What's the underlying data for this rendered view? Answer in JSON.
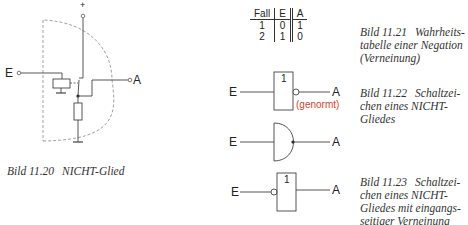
{
  "figure_11_20": {
    "supply_label": "+",
    "input_label": "E",
    "output_label": "A",
    "caption_number": "Bild 11.20",
    "caption_text": "NICHT-Glied"
  },
  "figure_11_21": {
    "table": {
      "headers": [
        "Fall",
        "E",
        "A"
      ],
      "rows": [
        [
          "1",
          "0",
          "1"
        ],
        [
          "2",
          "1",
          "0"
        ]
      ]
    },
    "caption_number": "Bild 11.21",
    "caption_text": "Wahrheits-\ntabelle einer Negation\n(Verneinung)"
  },
  "figure_11_22": {
    "symbol_a": {
      "box_label": "1",
      "input_label": "E",
      "output_label": "A",
      "note": "(genormt)",
      "note_color": "#d9442e"
    },
    "symbol_b": {
      "input_label": "E",
      "output_label": "A"
    },
    "caption_number": "Bild 11.22",
    "caption_text": "Schaltzei-\nchen eines NICHT-\nGliedes"
  },
  "figure_11_23": {
    "box_label": "1",
    "input_label": "E",
    "output_label": "A",
    "caption_number": "Bild 11.23",
    "caption_text": "Schaltzei-\nchen eines NICHT-\nGliedes mit eingangs-\nseitiger Verneinung"
  }
}
